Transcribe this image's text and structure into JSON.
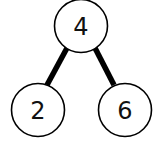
{
  "diagram": {
    "type": "binary-tree",
    "nodes": [
      {
        "id": "root",
        "label": "4",
        "cx": 81,
        "cy": 26,
        "r": 26.5
      },
      {
        "id": "left",
        "label": "2",
        "cx": 38,
        "cy": 110,
        "r": 26.5
      },
      {
        "id": "right",
        "label": "6",
        "cx": 125,
        "cy": 110,
        "r": 26.5
      }
    ],
    "edges": [
      {
        "from": "root",
        "to": "left"
      },
      {
        "from": "root",
        "to": "right"
      }
    ],
    "colors": {
      "stroke": "#000000",
      "fill": "#ffffff",
      "text": "#111111"
    }
  }
}
